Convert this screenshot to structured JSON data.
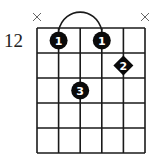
{
  "diagram": {
    "type": "guitar-chord",
    "base_fret_label": "12",
    "strings": 6,
    "frets_shown": 5,
    "muted_strings": [
      1,
      6
    ],
    "mute_symbol": "×",
    "barre": {
      "finger": 1,
      "fret": 1,
      "from_string": 2,
      "to_string": 4
    },
    "fingers": [
      {
        "finger": "1",
        "string": 2,
        "fret": 1,
        "shape": "circle"
      },
      {
        "finger": "1",
        "string": 4,
        "fret": 1,
        "shape": "circle"
      },
      {
        "finger": "2",
        "string": 5,
        "fret": 2,
        "shape": "diamond"
      },
      {
        "finger": "3",
        "string": 3,
        "fret": 3,
        "shape": "circle"
      }
    ]
  }
}
